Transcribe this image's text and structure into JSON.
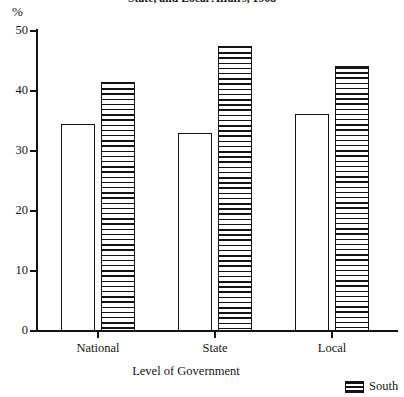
{
  "chart_data": {
    "type": "bar",
    "title": "State, and Local Affairs, 1968",
    "xlabel": "Level of Government",
    "ylabel": "%",
    "categories": [
      "National",
      "State",
      "Local"
    ],
    "series": [
      {
        "name": "",
        "pattern": "open",
        "values": [
          34.5,
          33.0,
          36.2
        ]
      },
      {
        "name": "South",
        "pattern": "horizontal-stripes",
        "values": [
          41.5,
          47.5,
          44.2
        ]
      }
    ],
    "ylim": [
      0,
      50
    ],
    "yticks": [
      0,
      10,
      20,
      30,
      40,
      50
    ],
    "ytick_labels": [
      "0",
      "10",
      "20",
      "30",
      "40",
      "50"
    ],
    "grid": false,
    "legend_position": "bottom-right",
    "legend": [
      {
        "label": "South",
        "pattern": "horizontal-stripes"
      }
    ]
  },
  "colors": {
    "ink": "#141414",
    "background": "#ffffff"
  }
}
